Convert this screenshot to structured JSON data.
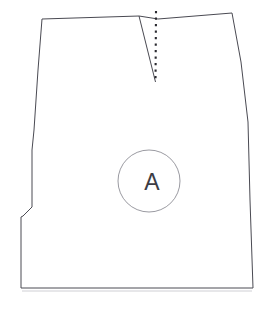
{
  "document": {
    "title": "Pattern Piece",
    "background_color": "#ffffff",
    "width": 274,
    "height": 310
  },
  "drawing": {
    "type": "sewing-pattern-piece",
    "description": "Skirt front panel pattern piece outline with waist dart and piece-identification circle",
    "line_color": "#4a4a52",
    "fill_color": "#ffffff",
    "marker_color": "#8e8e96",
    "foldline_color": "#2a2a30",
    "shadow_color": "#c9c9cf"
  },
  "piece_outline": {
    "name": "piece-outline",
    "closed": true,
    "points": "42,19 139,16 158,19 232,13 241,62 248,122 250,200 253,288 21,288 21,217 23,216 32,207 32,150 34,130 38,70"
  },
  "dart": {
    "name": "waist-dart",
    "leg_path": "M 139,16 L 155.5,82",
    "fold_line_path": "M 156,11 L 155.5,82",
    "apex_x": 155.5,
    "apex_y": 82,
    "style": "dotted"
  },
  "marker": {
    "name": "piece-label",
    "label": "A",
    "circle": {
      "cx": 149,
      "cy": 181,
      "r": 31
    },
    "text_x": 152,
    "text_y": 190
  },
  "shadow": {
    "name": "ground-shadow",
    "path": "M 22,291 L 252,291"
  }
}
